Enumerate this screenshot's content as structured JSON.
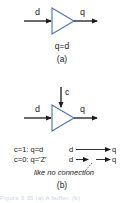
{
  "diagram": {
    "part_a": {
      "input_label": "d",
      "output_label": "q",
      "equation": "q=d",
      "caption": "(a)"
    },
    "part_b": {
      "control_label": "c",
      "input_label": "d",
      "output_label": "q",
      "truth_rows": [
        {
          "condition": "c=1: q=d",
          "from": "d",
          "to": "q",
          "connected": true
        },
        {
          "condition": "c=0: q='Z'",
          "from": "d",
          "to": "q",
          "connected": false
        }
      ],
      "annotation": "like no connection",
      "caption": "(b)"
    },
    "figure_caption_partial": "Figure 3.35 (a) A buffer. (b)"
  },
  "colors": {
    "gate_stroke": "#4a74a8",
    "line": "#1a1a1a",
    "caption_faint": "#c8d4e4"
  }
}
